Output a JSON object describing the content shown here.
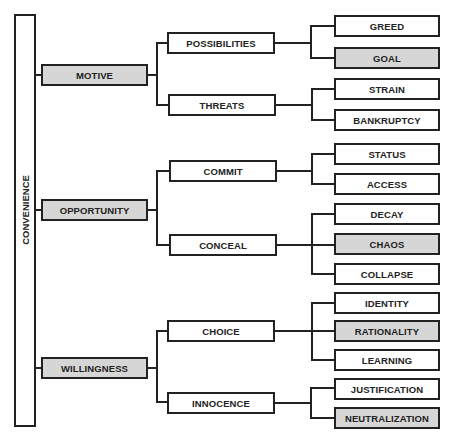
{
  "root": {
    "label": "CONVENIENCE"
  },
  "dimensions": [
    {
      "label": "MOTIVE",
      "shaded": true,
      "children": [
        {
          "label": "POSSIBILITIES",
          "children": [
            {
              "label": "GREED",
              "shaded": false
            },
            {
              "label": "GOAL",
              "shaded": true
            }
          ]
        },
        {
          "label": "THREATS",
          "children": [
            {
              "label": "STRAIN",
              "shaded": false
            },
            {
              "label": "BANKRUPTCY",
              "shaded": false
            }
          ]
        }
      ]
    },
    {
      "label": "OPPORTUNITY",
      "shaded": true,
      "children": [
        {
          "label": "COMMIT",
          "children": [
            {
              "label": "STATUS",
              "shaded": false
            },
            {
              "label": "ACCESS",
              "shaded": false
            }
          ]
        },
        {
          "label": "CONCEAL",
          "children": [
            {
              "label": "DECAY",
              "shaded": false
            },
            {
              "label": "CHAOS",
              "shaded": true
            },
            {
              "label": "COLLAPSE",
              "shaded": false
            }
          ]
        }
      ]
    },
    {
      "label": "WILLINGNESS",
      "shaded": true,
      "children": [
        {
          "label": "CHOICE",
          "children": [
            {
              "label": "IDENTITY",
              "shaded": false
            },
            {
              "label": "RATIONALITY",
              "shaded": true
            },
            {
              "label": "LEARNING",
              "shaded": false
            }
          ]
        },
        {
          "label": "INNOCENCE",
          "children": [
            {
              "label": "JUSTIFICATION",
              "shaded": false
            },
            {
              "label": "NEUTRALIZATION",
              "shaded": true
            }
          ]
        }
      ]
    }
  ],
  "colors": {
    "line": "#222222",
    "shaded_fill": "#d6d6d6",
    "fill": "#ffffff"
  }
}
